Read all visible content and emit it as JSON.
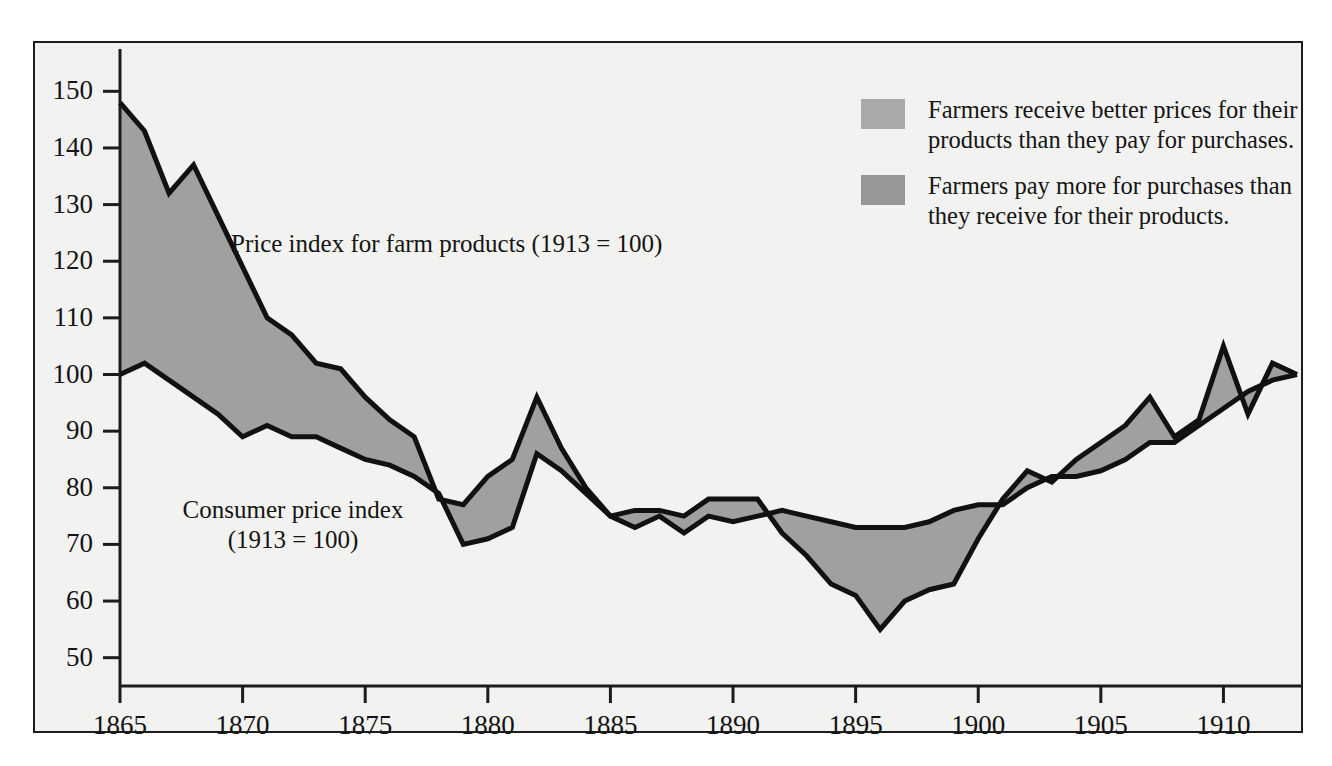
{
  "figure": {
    "background_color": "#ffffff",
    "plate_color": "#f2f2f0",
    "frame_color": "#1c1c1c"
  },
  "legend": {
    "position": "top-right",
    "items": [
      {
        "swatch_color": "#a9a9a9",
        "label": "Farmers receive better prices for their\nproducts than they pay for purchases."
      },
      {
        "swatch_color": "#979797",
        "label": "Farmers pay more for purchases than\nthey receive for their products."
      }
    ]
  },
  "annotations": {
    "farm_label": "Price index for farm products (1913 = 100)",
    "cpi_label": "Consumer price index\n(1913 = 100)"
  },
  "chart_data": {
    "type": "line",
    "title": "",
    "subtitle": "",
    "xlabel": "",
    "ylabel": "",
    "xlim": [
      1865,
      1913
    ],
    "ylim": [
      45,
      155
    ],
    "grid": false,
    "legend_position": "top-right",
    "fill_between": true,
    "fill_color": "#a0a0a0",
    "line_color": "#111111",
    "line_width_px": 5,
    "xticks": [
      1865,
      1870,
      1875,
      1880,
      1885,
      1890,
      1895,
      1900,
      1905,
      1910
    ],
    "xtick_labels": [
      "1865",
      "1870",
      "1875",
      "1880",
      "1885",
      "1890",
      "1895",
      "1900",
      "1905",
      "1910"
    ],
    "yticks": [
      50,
      60,
      70,
      80,
      90,
      100,
      110,
      120,
      130,
      140,
      150
    ],
    "ytick_labels": [
      "50",
      "60",
      "70",
      "80",
      "90",
      "100",
      "110",
      "120",
      "130",
      "140",
      "150"
    ],
    "x": [
      1865,
      1866,
      1867,
      1868,
      1869,
      1870,
      1871,
      1872,
      1873,
      1874,
      1875,
      1876,
      1877,
      1878,
      1879,
      1880,
      1881,
      1882,
      1883,
      1884,
      1885,
      1886,
      1887,
      1888,
      1889,
      1890,
      1891,
      1892,
      1893,
      1894,
      1895,
      1896,
      1897,
      1898,
      1899,
      1900,
      1901,
      1902,
      1903,
      1904,
      1905,
      1906,
      1907,
      1908,
      1909,
      1910,
      1911,
      1912,
      1913
    ],
    "series": [
      {
        "name": "Price index for farm products (1913 = 100)",
        "values": [
          148,
          143,
          132,
          137,
          128,
          119,
          110,
          107,
          102,
          101,
          96,
          92,
          89,
          78,
          77,
          82,
          85,
          96,
          87,
          80,
          75,
          76,
          76,
          75,
          78,
          78,
          78,
          72,
          68,
          63,
          61,
          55,
          60,
          62,
          63,
          71,
          78,
          83,
          81,
          85,
          88,
          91,
          96,
          89,
          92,
          105,
          93,
          102,
          100
        ]
      },
      {
        "name": "Consumer price index (1913 = 100)",
        "values": [
          100,
          102,
          99,
          96,
          93,
          89,
          91,
          89,
          89,
          87,
          85,
          84,
          82,
          79,
          70,
          71,
          73,
          86,
          83,
          79,
          75,
          73,
          75,
          72,
          75,
          74,
          75,
          76,
          75,
          74,
          73,
          73,
          73,
          74,
          76,
          77,
          77,
          80,
          82,
          82,
          83,
          85,
          88,
          88,
          91,
          94,
          97,
          99,
          100
        ]
      }
    ]
  }
}
